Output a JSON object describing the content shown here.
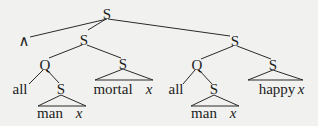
{
  "diagram": {
    "type": "syntax-tree",
    "colors": {
      "background": "#f1f1ef",
      "ink": "#1c1c1c"
    },
    "nodes": {
      "root": {
        "label": "S"
      },
      "conj": {
        "label": "∧"
      },
      "left_s": {
        "label": "S"
      },
      "right_s": {
        "label": "S"
      },
      "left_q": {
        "label": "Q"
      },
      "left_pred_s": {
        "label": "S"
      },
      "right_q": {
        "label": "Q"
      },
      "right_pred_s": {
        "label": "S"
      },
      "left_all": {
        "label": "all"
      },
      "left_restr_s": {
        "label": "S"
      },
      "right_all": {
        "label": "all"
      },
      "right_restr_s": {
        "label": "S"
      }
    },
    "leaves": {
      "left_restr": {
        "word": "man",
        "var": "x"
      },
      "left_pred": {
        "word": "mortal",
        "var": "x"
      },
      "right_restr": {
        "word": "man",
        "var": "x"
      },
      "right_pred": {
        "word": "happy",
        "var": "x"
      }
    }
  }
}
